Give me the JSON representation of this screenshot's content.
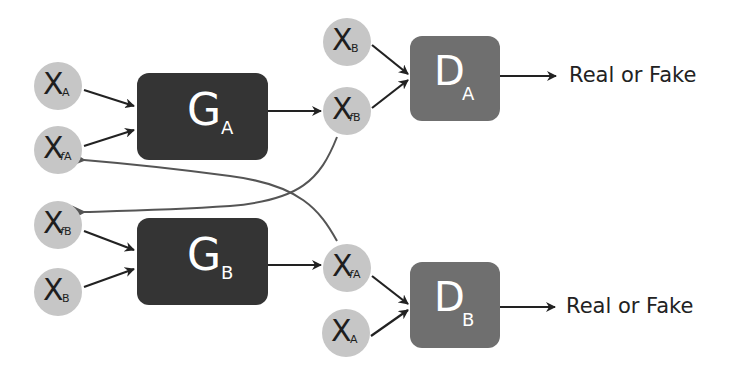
{
  "diagram": {
    "colors": {
      "background": "#ffffff",
      "input_node_fill": "#c6c6c6",
      "generator_fill": "#343434",
      "discriminator_fill": "#6f6f6f",
      "arrow": "#222222",
      "feedback_arrow": "#555555",
      "label_text": "#222222"
    },
    "nodes": {
      "top_xa": {
        "main": "X",
        "sub": "A"
      },
      "top_xfa": {
        "main": "X",
        "sub_f": "f",
        "sub": "A"
      },
      "top_xb": {
        "main": "X",
        "sub": "B"
      },
      "top_xfb": {
        "main": "X",
        "sub_f": "f",
        "sub": "B"
      },
      "bot_xfb": {
        "main": "X",
        "sub_f": "f",
        "sub": "B"
      },
      "bot_xb": {
        "main": "X",
        "sub": "B"
      },
      "bot_xfa": {
        "main": "X",
        "sub_f": "f",
        "sub": "A"
      },
      "bot_xa": {
        "main": "X",
        "sub": "A"
      }
    },
    "generators": {
      "ga": {
        "main": "G",
        "sub": "A"
      },
      "gb": {
        "main": "G",
        "sub": "B"
      }
    },
    "discriminators": {
      "da": {
        "main": "D",
        "sub": "A"
      },
      "db": {
        "main": "D",
        "sub": "B"
      }
    },
    "outputs": {
      "da_output": "Real or Fake",
      "db_output": "Real or Fake"
    },
    "edges": [
      {
        "from": "X_A",
        "to": "G_A"
      },
      {
        "from": "X_fA",
        "to": "G_A"
      },
      {
        "from": "G_A",
        "to": "X_fB"
      },
      {
        "from": "X_B",
        "to": "D_A"
      },
      {
        "from": "X_fB",
        "to": "D_A"
      },
      {
        "from": "D_A",
        "to": "Real or Fake"
      },
      {
        "from": "X_fB",
        "to": "X_fB (G_B input)",
        "type": "feedback"
      },
      {
        "from": "X_fA",
        "to": "X_fA (G_A input)",
        "type": "feedback"
      },
      {
        "from": "X_fB",
        "to": "G_B"
      },
      {
        "from": "X_B",
        "to": "G_B"
      },
      {
        "from": "G_B",
        "to": "X_fA"
      },
      {
        "from": "X_fA",
        "to": "D_B"
      },
      {
        "from": "X_A",
        "to": "D_B"
      },
      {
        "from": "D_B",
        "to": "Real or Fake"
      }
    ]
  }
}
